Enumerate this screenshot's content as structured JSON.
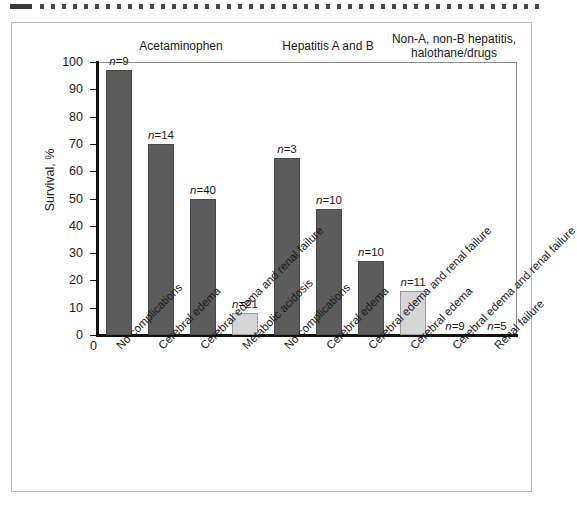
{
  "figure": {
    "ylabel": "Survival, %",
    "x_origin_label": "0",
    "groups": [
      {
        "label": "Acetaminophen",
        "bars": 4
      },
      {
        "label": "Hepatitis A and B",
        "bars": 3
      },
      {
        "label": "Non-A, non-B hepatitis,\nhalothane/drugs",
        "bars": 2
      }
    ]
  },
  "chart_data": {
    "type": "bar",
    "title": "",
    "xlabel": "",
    "ylabel": "Survival, %",
    "ylim": [
      0,
      100
    ],
    "yticks": [
      0,
      10,
      20,
      30,
      40,
      50,
      60,
      70,
      80,
      90,
      100
    ],
    "grid": false,
    "legend": null,
    "group_headers": [
      "Acetaminophen",
      "Hepatitis A and B",
      "Non-A, non-B hepatitis, halothane/drugs"
    ],
    "categories": [
      "No complications",
      "Cerebral edema",
      "Cerebral edema and renal failure",
      "Metabolic acidosis",
      "No complications",
      "Cerebral edema",
      "Cerebral edema and renal failure",
      "Cerebral edema",
      "Cerebral edema and renal failure",
      "Renal failure"
    ],
    "bars": [
      {
        "group": "Acetaminophen",
        "category": "No complications",
        "value": 97,
        "n": 9,
        "n_label": "n=9",
        "color": "#5c5c5c",
        "shade": "dark"
      },
      {
        "group": "Acetaminophen",
        "category": "Cerebral edema",
        "value": 70,
        "n": 14,
        "n_label": "n=14",
        "color": "#5c5c5c",
        "shade": "dark"
      },
      {
        "group": "Acetaminophen",
        "category": "Cerebral edema and renal failure",
        "value": 50,
        "n": 40,
        "n_label": "n=40",
        "color": "#5c5c5c",
        "shade": "dark"
      },
      {
        "group": "Acetaminophen",
        "category": "Metabolic acidosis",
        "value": 8,
        "n": 21,
        "n_label": "n=21",
        "color": "#d6d6d6",
        "shade": "light"
      },
      {
        "group": "Hepatitis A and B",
        "category": "No complications",
        "value": 65,
        "n": 3,
        "n_label": "n=3",
        "color": "#5c5c5c",
        "shade": "dark"
      },
      {
        "group": "Hepatitis A and B",
        "category": "Cerebral edema",
        "value": 46,
        "n": 10,
        "n_label": "n=10",
        "color": "#5c5c5c",
        "shade": "dark"
      },
      {
        "group": "Hepatitis A and B",
        "category": "Cerebral edema and renal failure",
        "value": 27,
        "n": 10,
        "n_label": "n=10",
        "color": "#5c5c5c",
        "shade": "dark"
      },
      {
        "group": "Non-A, non-B hepatitis, halothane/drugs",
        "category": "Cerebral edema",
        "value": 16,
        "n": 11,
        "n_label": "n=11",
        "color": "#d6d6d6",
        "shade": "light"
      },
      {
        "group": "Non-A, non-B hepatitis, halothane/drugs",
        "category": "Cerebral edema and renal failure",
        "value": 0,
        "n": 9,
        "n_label": "n=9",
        "color": "#5c5c5c",
        "shade": "dark"
      },
      {
        "group": "Non-A, non-B hepatitis, halothane/drugs",
        "category": "Renal failure",
        "value": 0,
        "n": 5,
        "n_label": "n=5",
        "color": "#5c5c5c",
        "shade": "dark"
      }
    ]
  },
  "colors": {
    "bar_dark": "#5c5c5c",
    "bar_light": "#d6d6d6",
    "axis": "#111111",
    "frame": "#b9b9b9",
    "text": "#1a1a1a"
  }
}
